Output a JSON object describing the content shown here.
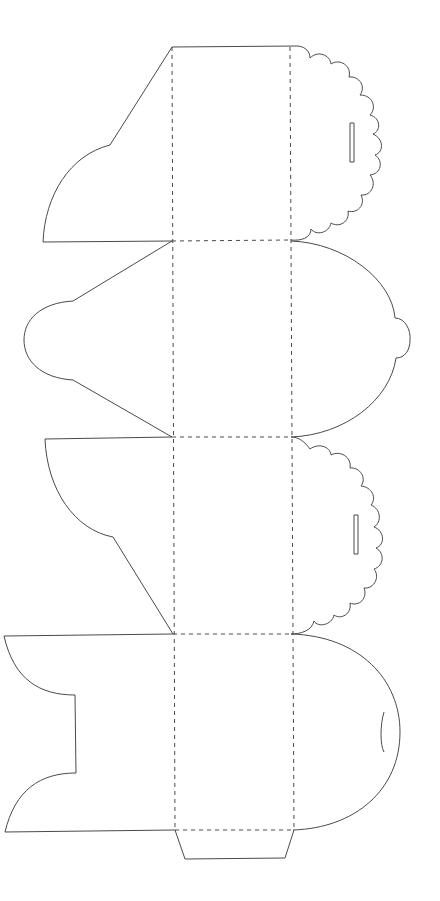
{
  "diagram": {
    "type": "box-template-dieline",
    "stroke_color": "#4a4a4a",
    "background": "#ffffff",
    "panels": [
      {
        "name": "panel-1",
        "y_top": 47,
        "y_bottom": 241
      },
      {
        "name": "panel-2",
        "y_top": 241,
        "y_bottom": 437
      },
      {
        "name": "panel-3",
        "y_top": 437,
        "y_bottom": 634
      },
      {
        "name": "panel-4",
        "y_top": 634,
        "y_bottom": 830
      }
    ],
    "fold_lines": {
      "x_left": 172,
      "x_right": 291
    },
    "paths": {
      "panel1_left_flap": "M172,47 L110,145 C70,155 45,195 43,242 L172,241",
      "panel1_top_edge": "M172,47 L298,46",
      "panel1_scallop": "M298,46 C306,47 310,52 310,58 C318,50 330,55 331,64 C340,58 352,66 349,77 C360,76 366,87 360,95 C373,95 377,108 370,115 C381,118 381,131 373,134 C384,139 384,152 375,155 C384,161 381,174 370,175 C377,183 372,196 361,195 C366,205 357,214 348,211 C350,222 339,228 331,223 C329,233 316,236 311,229 C311,238 301,241 291,240",
      "panel2_left_flap": "M172,241 L73,301 C40,303 24,320 24,340 C24,360 40,378 73,380 L172,437",
      "panel2_right_arc": "M291,241 C345,243 392,280 395,318 C405,318 411,330 410,340 C410,350 405,358 396,358 C390,400 345,435 291,437",
      "panel3_left_flap": "M172,437 L45,439 C47,490 75,530 113,537 L173,634",
      "panel3_scallop": "M291,437 C299,437 305,442 310,449 C318,443 330,446 331,455 C340,450 352,457 350,468 C360,467 367,478 361,486 C372,487 377,498 371,505 C381,509 382,522 374,527 C385,531 385,545 376,548 C385,553 384,566 374,569 C380,576 375,589 364,588 C368,598 359,607 350,603 C352,614 341,620 334,615 C332,625 318,628 314,621 C312,631 300,634 291,634",
      "panel4_left_flap": "M173,634 L4,636 C14,680 40,695 75,695 L76,773 C40,773 15,790 5,832 L175,830",
      "panel4_right_arc": "M291,634 C360,636 400,680 400,732 C400,790 355,828 293,830",
      "bottom_tab": "M175,830 L185,859 L285,858 L294,830",
      "slot_1": "M350,123 L354,123 L354,162 L350,162 Z",
      "slot_2": "M354,515 L358,515 L358,554 L354,554 Z",
      "slit_4": "M384,712 C380,725 380,745 384,752"
    },
    "fold_paths": {
      "v_left": "M172,47 L175,830",
      "v_right": "M290,47 L294,830",
      "h_1": "M172,241 L291,240",
      "h_2": "M172,437 L291,437",
      "h_3": "M173,634 L291,634",
      "h_4": "M175,830 L294,830"
    }
  }
}
